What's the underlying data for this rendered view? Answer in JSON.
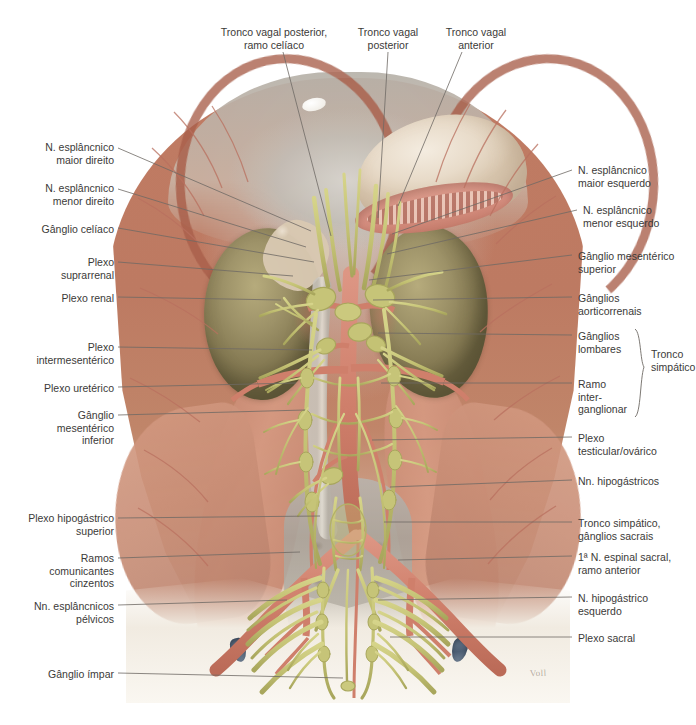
{
  "figure": {
    "signature": "Voll",
    "width": 696,
    "height": 725,
    "background": "#ffffff"
  },
  "colors": {
    "label_text": "#3b3a38",
    "leader_line": "#6e6a64",
    "muscle": "#c5866f",
    "kidney": "#9d9268",
    "nerve": "#c9c878",
    "artery": "#d07f6d",
    "vein": "#5e6f84",
    "bone": "#b4b0a6",
    "stomach": "#e8dbc9"
  },
  "labels": {
    "top": [
      {
        "id": "tronco-vagal-posterior-ramo-celiaco",
        "text": "Tronco vagal posterior,\nramo celíaco",
        "x": 207,
        "y": 26,
        "width": 134,
        "anchor_x": 283,
        "anchor_y": 52,
        "target_x": 331,
        "target_y": 236
      },
      {
        "id": "tronco-vagal-posterior",
        "text": "Tronco vagal\nposterior",
        "x": 347,
        "y": 26,
        "width": 82,
        "anchor_x": 388,
        "anchor_y": 52,
        "target_x": 378,
        "target_y": 218
      },
      {
        "id": "tronco-vagal-anterior",
        "text": "Tronco vagal\nanterior",
        "x": 435,
        "y": 26,
        "width": 82,
        "anchor_x": 462,
        "anchor_y": 52,
        "target_x": 398,
        "target_y": 206
      }
    ],
    "left": [
      {
        "id": "n-esplancnico-maior-direito",
        "text": "N. esplâncnico\nmaior direito",
        "x": 18,
        "y": 141,
        "width": 96,
        "anchor_x": 118,
        "anchor_y": 148,
        "target_x": 311,
        "target_y": 231
      },
      {
        "id": "n-esplancnico-menor-direito",
        "text": "N. esplâncnico\nmenor direito",
        "x": 18,
        "y": 182,
        "width": 96,
        "anchor_x": 118,
        "anchor_y": 189,
        "target_x": 306,
        "target_y": 247
      },
      {
        "id": "ganglio-celiaco",
        "text": "Gânglio celíaco",
        "x": 18,
        "y": 223,
        "width": 96,
        "anchor_x": 118,
        "anchor_y": 228,
        "target_x": 314,
        "target_y": 262
      },
      {
        "id": "plexo-suprarrenal",
        "text": "Plexo\nsuprarrenal",
        "x": 18,
        "y": 256,
        "width": 96,
        "anchor_x": 118,
        "anchor_y": 262,
        "target_x": 293,
        "target_y": 276
      },
      {
        "id": "plexo-renal",
        "text": "Plexo renal",
        "x": 18,
        "y": 292,
        "width": 96,
        "anchor_x": 118,
        "anchor_y": 297,
        "target_x": 281,
        "target_y": 300
      },
      {
        "id": "plexo-intermesenterico",
        "text": "Plexo\nintermesentérico",
        "x": 18,
        "y": 341,
        "width": 96,
        "anchor_x": 118,
        "anchor_y": 347,
        "target_x": 312,
        "target_y": 350
      },
      {
        "id": "plexo-ureterico",
        "text": "Plexo uretérico",
        "x": 18,
        "y": 382,
        "width": 96,
        "anchor_x": 118,
        "anchor_y": 387,
        "target_x": 296,
        "target_y": 383
      },
      {
        "id": "ganglio-mesenterico-inferior",
        "text": "Gânglio\nmesentérico\ninferior",
        "x": 18,
        "y": 409,
        "width": 96,
        "anchor_x": 118,
        "anchor_y": 415,
        "target_x": 305,
        "target_y": 410
      },
      {
        "id": "plexo-hipogastrico-superior",
        "text": "Plexo hipogástrico\nsuperior",
        "x": 8,
        "y": 512,
        "width": 106,
        "anchor_x": 118,
        "anchor_y": 518,
        "target_x": 320,
        "target_y": 516
      },
      {
        "id": "ramos-comunicantes-cinzentos",
        "text": "Ramos\ncomunicantes\ncinzentos",
        "x": 18,
        "y": 552,
        "width": 96,
        "anchor_x": 118,
        "anchor_y": 558,
        "target_x": 300,
        "target_y": 552
      },
      {
        "id": "nn-esplancnicos-pelvicos",
        "text": "Nn. esplâncnicos\npélvicos",
        "x": 12,
        "y": 600,
        "width": 102,
        "anchor_x": 118,
        "anchor_y": 605,
        "target_x": 287,
        "target_y": 600
      },
      {
        "id": "ganglio-impar",
        "text": "Gânglio ímpar",
        "x": 18,
        "y": 668,
        "width": 96,
        "anchor_x": 118,
        "anchor_y": 673,
        "target_x": 343,
        "target_y": 678
      }
    ],
    "right": [
      {
        "id": "n-esplancnico-maior-esquerdo",
        "text": "N. esplâncnico\nmaior esquerdo",
        "x": 578,
        "y": 164,
        "width": 110,
        "anchor_x": 572,
        "anchor_y": 170,
        "target_x": 392,
        "target_y": 234
      },
      {
        "id": "n-esplancnico-menor-esquerdo",
        "text": "N. esplâncnico\nmenor esquerdo",
        "x": 583,
        "y": 204,
        "width": 110,
        "anchor_x": 577,
        "anchor_y": 210,
        "target_x": 387,
        "target_y": 254
      },
      {
        "id": "ganglio-mesenterico-superior",
        "text": "Gânglio mesentérico\nsuperior",
        "x": 578,
        "y": 250,
        "width": 116,
        "anchor_x": 572,
        "anchor_y": 255,
        "target_x": 369,
        "target_y": 280
      },
      {
        "id": "ganglios-aorticorrenais",
        "text": "Gânglios\naorticorrenais",
        "x": 578,
        "y": 292,
        "width": 110,
        "anchor_x": 572,
        "anchor_y": 297,
        "target_x": 373,
        "target_y": 300
      },
      {
        "id": "ganglios-lombares",
        "text": "Gânglios\nlombares",
        "x": 578,
        "y": 330,
        "width": 72,
        "anchor_x": 572,
        "anchor_y": 335,
        "target_x": 378,
        "target_y": 333
      },
      {
        "id": "ramo-interganglionar",
        "text": "Ramo\ninter-\nganglionar",
        "x": 578,
        "y": 378,
        "width": 72,
        "anchor_x": 572,
        "anchor_y": 383,
        "target_x": 381,
        "target_y": 383
      },
      {
        "id": "plexo-testicular-ovarico",
        "text": "Plexo\ntesticular/ovárico",
        "x": 578,
        "y": 432,
        "width": 116,
        "anchor_x": 572,
        "anchor_y": 437,
        "target_x": 372,
        "target_y": 440
      },
      {
        "id": "nn-hipogastricos",
        "text": "Nn. hipogástricos",
        "x": 578,
        "y": 475,
        "width": 116,
        "anchor_x": 572,
        "anchor_y": 480,
        "target_x": 390,
        "target_y": 487
      },
      {
        "id": "tronco-simpatico-ganglios-sacrais",
        "text": "Tronco simpático,\ngânglios sacrais",
        "x": 578,
        "y": 517,
        "width": 116,
        "anchor_x": 572,
        "anchor_y": 522,
        "target_x": 384,
        "target_y": 522
      },
      {
        "id": "primeiro-n-espinal-sacral",
        "text": "1ª N. espinal sacral,\nramo anterior",
        "x": 578,
        "y": 551,
        "width": 116,
        "anchor_x": 572,
        "anchor_y": 556,
        "target_x": 398,
        "target_y": 560
      },
      {
        "id": "n-hipogastrico-esquerdo",
        "text": "N. hipogástrico\nesquerdo",
        "x": 578,
        "y": 592,
        "width": 116,
        "anchor_x": 572,
        "anchor_y": 597,
        "target_x": 378,
        "target_y": 600
      },
      {
        "id": "plexo-sacral",
        "text": "Plexo sacral",
        "x": 578,
        "y": 632,
        "width": 116,
        "anchor_x": 572,
        "anchor_y": 637,
        "target_x": 390,
        "target_y": 637
      }
    ],
    "brace": {
      "id": "tronco-simpatico",
      "text": "Tronco\nsimpático",
      "x": 651,
      "y": 348,
      "brace_x": 641,
      "brace_top": 329,
      "brace_bottom": 417
    }
  }
}
